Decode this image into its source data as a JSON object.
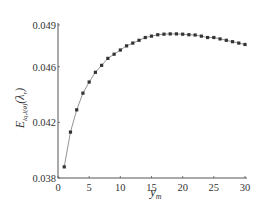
{
  "chart_data": {
    "type": "line",
    "title": "",
    "xlabel": "y_m",
    "xlabel_main": "y",
    "xlabel_sub": "m",
    "ylabel": "E_{lq,l(θ)}(λ_r)",
    "ylabel_main": "E",
    "ylabel_sub": "lq,l(θ)",
    "ylabel_tail": "(λ",
    "ylabel_tail_sub": "r",
    "ylabel_close": ")",
    "xlim": [
      0,
      30
    ],
    "ylim": [
      0.038,
      0.049
    ],
    "x_ticks": [
      0,
      5,
      10,
      15,
      20,
      25,
      30
    ],
    "x_tick_labels": [
      "0",
      "5",
      "10",
      "15",
      "20",
      "25",
      "30"
    ],
    "y_ticks": [
      0.038,
      0.042,
      0.046,
      0.049
    ],
    "y_tick_labels": [
      "0.038",
      "0.042",
      "0.046",
      "0.049"
    ],
    "grid": false,
    "legend": null,
    "series": [
      {
        "name": "E",
        "marker": "square",
        "line": "solid",
        "color": "#333333",
        "x": [
          1,
          2,
          3,
          4,
          5,
          6,
          7,
          8,
          9,
          10,
          11,
          12,
          13,
          14,
          15,
          16,
          17,
          18,
          19,
          20,
          21,
          22,
          23,
          24,
          25,
          26,
          27,
          28,
          29,
          30
        ],
        "values": [
          0.0388,
          0.0413,
          0.0429,
          0.0441,
          0.0449,
          0.0456,
          0.0461,
          0.0466,
          0.0469,
          0.0472,
          0.0475,
          0.0477,
          0.0479,
          0.0481,
          0.0482,
          0.0483,
          0.04834,
          0.04836,
          0.04836,
          0.04834,
          0.0483,
          0.04828,
          0.0482,
          0.0481,
          0.0481,
          0.048,
          0.0479,
          0.0478,
          0.0477,
          0.0476
        ]
      }
    ]
  }
}
